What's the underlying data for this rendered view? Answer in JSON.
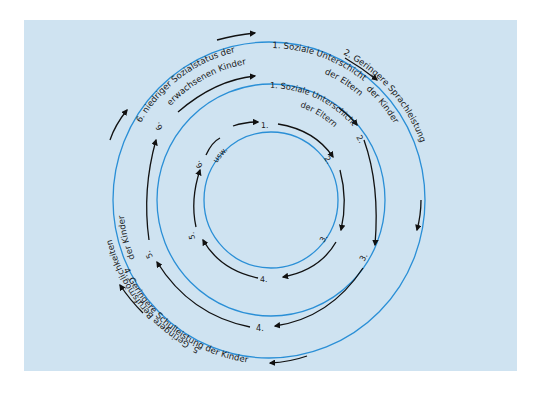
{
  "diagram": {
    "title": "",
    "colors": {
      "background": "#cfe3f1",
      "circle": "#2a8fd6",
      "arrow": "#111111"
    },
    "outer_cycle": {
      "step1_line1": "1. Soziale Unterschicht",
      "step1_line2": "der Eltern",
      "step2_line1": "2. Geringere Sprachleistung",
      "step2_line2": "der Kinder",
      "step3": "3. Geringere Intelligenzleistung der Kinder",
      "step4": "4. Geringere Schulleistung der Kinder",
      "step5_line1": "5. Geringere Berufsmöglichkeiten",
      "step5_line2": "der Kinder",
      "step6_line1": "6. niedriger Sozialstatus der",
      "step6_line2": "erwachsenen Kinder"
    },
    "middle_cycle": {
      "step1_line1": "1. Soziale Unterschicht",
      "step1_line2": "der Eltern",
      "step2": "2.",
      "step3": "3.",
      "step4": "4.",
      "step5": "5.",
      "step6": "6."
    },
    "inner_cycle": {
      "step1": "1.",
      "step2": "2.",
      "step3": "3.",
      "step4": "4.",
      "step5": "5.",
      "step6": "6.",
      "continuation": "usw."
    }
  }
}
